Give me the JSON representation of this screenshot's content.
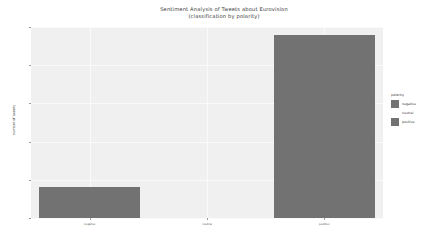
{
  "chart_data": {
    "type": "bar",
    "title": "Sentiment Analysis of Tweets about Eurovision",
    "subtitle": "(classification by polarity)",
    "xlabel": "",
    "ylabel": "number of tweets",
    "categories": [
      "negative",
      "neutral",
      "positive"
    ],
    "values": [
      200,
      0,
      1200
    ],
    "ylim": [
      0,
      1250
    ],
    "yticks": [
      "0",
      "250",
      "500",
      "750",
      "1000",
      "1250"
    ],
    "ytick_values": [
      0,
      250,
      500,
      750,
      1000,
      1250
    ],
    "grid": true,
    "legend": {
      "position": "right",
      "title": "polarity",
      "entries": [
        {
          "label": "negative",
          "color": "#727272"
        },
        {
          "label": "neutral",
          "color": "#ffffff"
        },
        {
          "label": "positive",
          "color": "#727272"
        }
      ]
    },
    "series": [
      {
        "name": "polarity",
        "values": [
          200,
          0,
          1200
        ]
      }
    ],
    "bar_colors": [
      "#727272",
      "#ffffff",
      "#727272"
    ],
    "panel_color": "#f0f0f0",
    "figure_color": "#ffffff",
    "grid_color": "#fafafa"
  }
}
